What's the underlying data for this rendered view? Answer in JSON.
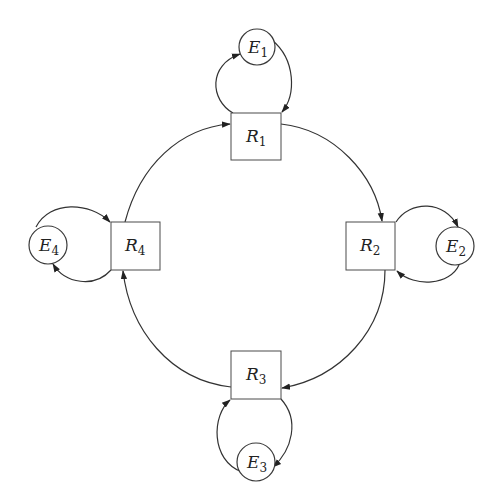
{
  "diagram": {
    "type": "cycle-with-self-loops",
    "colors": {
      "stroke": "#333333",
      "background": "#ffffff",
      "text": "#222222"
    },
    "resource_nodes": [
      {
        "id": "R1",
        "letter": "R",
        "sub": "1",
        "shape": "square"
      },
      {
        "id": "R2",
        "letter": "R",
        "sub": "2",
        "shape": "square"
      },
      {
        "id": "R3",
        "letter": "R",
        "sub": "3",
        "shape": "square"
      },
      {
        "id": "R4",
        "letter": "R",
        "sub": "4",
        "shape": "square"
      }
    ],
    "entity_nodes": [
      {
        "id": "E1",
        "letter": "E",
        "sub": "1",
        "shape": "circle"
      },
      {
        "id": "E2",
        "letter": "E",
        "sub": "2",
        "shape": "circle"
      },
      {
        "id": "E3",
        "letter": "E",
        "sub": "3",
        "shape": "circle"
      },
      {
        "id": "E4",
        "letter": "E",
        "sub": "4",
        "shape": "circle"
      }
    ],
    "edges": [
      {
        "from": "R1",
        "to": "R2",
        "style": "arc-clockwise"
      },
      {
        "from": "R2",
        "to": "R3",
        "style": "arc-clockwise"
      },
      {
        "from": "R3",
        "to": "R4",
        "style": "arc-clockwise"
      },
      {
        "from": "R4",
        "to": "R1",
        "style": "arc-clockwise"
      },
      {
        "from": "R1",
        "to": "E1",
        "style": "loop"
      },
      {
        "from": "E1",
        "to": "R1",
        "style": "loop"
      },
      {
        "from": "R2",
        "to": "E2",
        "style": "loop"
      },
      {
        "from": "E2",
        "to": "R2",
        "style": "loop"
      },
      {
        "from": "R3",
        "to": "E3",
        "style": "loop"
      },
      {
        "from": "E3",
        "to": "R3",
        "style": "loop"
      },
      {
        "from": "R4",
        "to": "E4",
        "style": "loop"
      },
      {
        "from": "E4",
        "to": "R4",
        "style": "loop"
      }
    ]
  }
}
